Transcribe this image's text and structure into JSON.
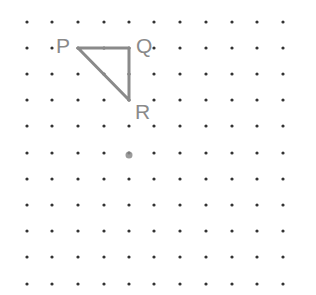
{
  "diagram": {
    "type": "dot-grid",
    "grid": {
      "columns": 11,
      "rows": 11,
      "x_positions": [
        27,
        52,
        78,
        104,
        129,
        154,
        180,
        206,
        232,
        257,
        283
      ],
      "y_positions": [
        22,
        48,
        74,
        100,
        126,
        153,
        179,
        205,
        231,
        257,
        284
      ],
      "dot_color": "#333333",
      "dot_radius": 1.6
    },
    "triangle": {
      "stroke_color": "#8a8a8a",
      "stroke_width": 3,
      "vertices": [
        {
          "label": "P",
          "col": 2,
          "row": 1
        },
        {
          "label": "Q",
          "col": 4,
          "row": 1
        },
        {
          "label": "R",
          "col": 4,
          "row": 3
        }
      ]
    },
    "labels": {
      "p": "P",
      "q": "Q",
      "r": "R"
    },
    "highlighted_point": {
      "col": 4,
      "row": 5,
      "color": "#8a8a8a",
      "radius": 3.5
    }
  }
}
